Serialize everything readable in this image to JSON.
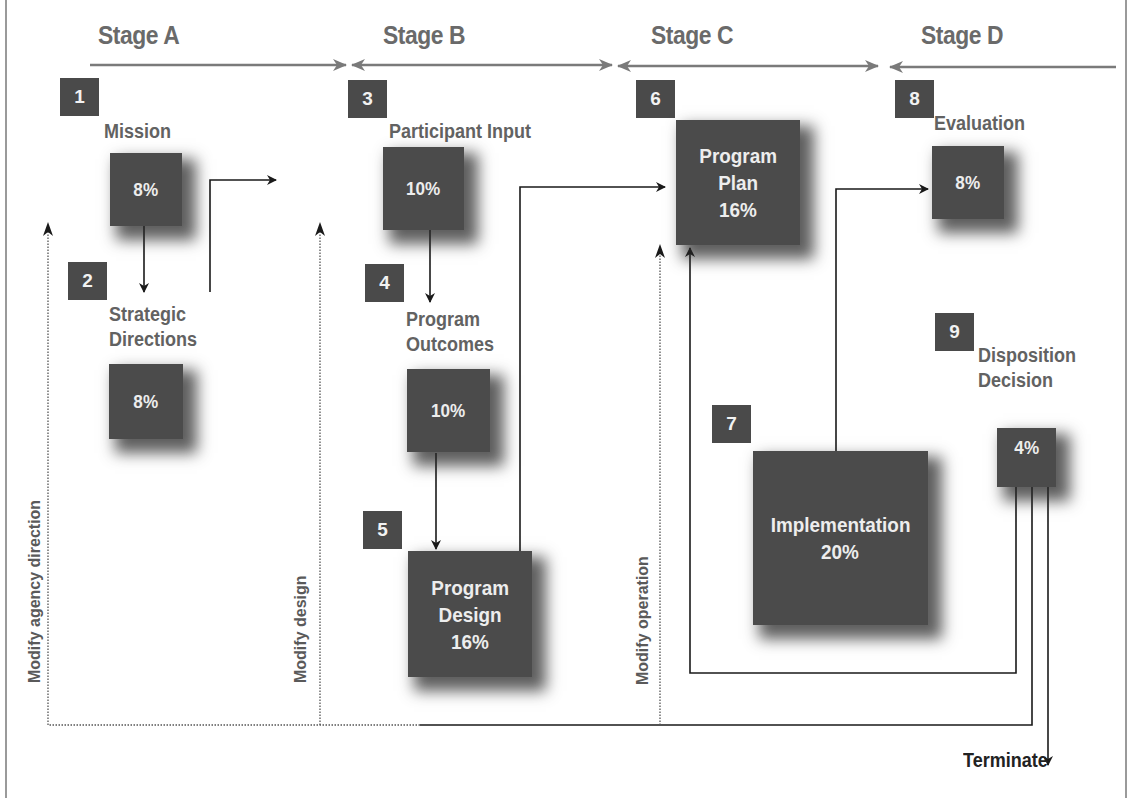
{
  "stages": [
    {
      "label": "Stage A"
    },
    {
      "label": "Stage B"
    },
    {
      "label": "Stage C"
    },
    {
      "label": "Stage D"
    }
  ],
  "steps": [
    {
      "number": "1",
      "title": "Mission",
      "percent": "8%"
    },
    {
      "number": "2",
      "title_line1": "Strategic",
      "title_line2": "Directions",
      "percent": "8%"
    },
    {
      "number": "3",
      "title": "Participant Input",
      "percent": "10%"
    },
    {
      "number": "4",
      "title_line1": "Program",
      "title_line2": "Outcomes",
      "percent": "10%"
    },
    {
      "number": "5",
      "title_line1": "Program",
      "title_line2": "Design",
      "percent": "16%"
    },
    {
      "number": "6",
      "title_line1": "Program",
      "title_line2": "Plan",
      "percent": "16%"
    },
    {
      "number": "7",
      "title": "Implementation",
      "percent": "20%"
    },
    {
      "number": "8",
      "title": "Evaluation",
      "percent": "8%"
    },
    {
      "number": "9",
      "title_line1": "Disposition",
      "title_line2": "Decision",
      "percent": "4%"
    }
  ],
  "feedback_labels": {
    "agency": "Modify agency direction",
    "design": "Modify design",
    "operation": "Modify operation"
  },
  "terminal": {
    "label": "Terminate"
  },
  "colors": {
    "box": "#4b4b4b",
    "stage_text": "#6a6a6a",
    "stage_arrow": "#7a7a7a",
    "connector": "#1a1a1a"
  }
}
